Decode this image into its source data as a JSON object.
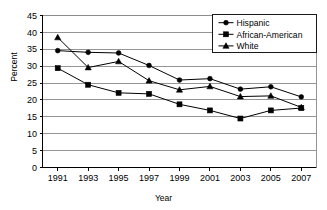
{
  "chart_data": {
    "type": "line",
    "title": "",
    "xlabel": "Year",
    "ylabel": "Percent",
    "categories": [
      "1991",
      "1993",
      "1995",
      "1997",
      "1999",
      "2001",
      "2003",
      "2005",
      "2007"
    ],
    "x": [
      1991,
      1993,
      1995,
      1997,
      1999,
      2001,
      2003,
      2005,
      2007
    ],
    "ylim": [
      0,
      45
    ],
    "yticks": [
      0,
      5,
      10,
      15,
      20,
      25,
      30,
      35,
      40,
      45
    ],
    "grid": "horizontal",
    "legend_position": "top-right-inside",
    "series": [
      {
        "name": "Hispanic",
        "marker": "circle",
        "values": [
          34.6,
          34.1,
          33.9,
          30.2,
          25.9,
          26.3,
          23.2,
          23.9,
          20.9
        ]
      },
      {
        "name": "African-American",
        "marker": "square",
        "values": [
          29.4,
          24.5,
          22.1,
          21.8,
          18.7,
          16.9,
          14.5,
          16.9,
          17.6
        ]
      },
      {
        "name": "White",
        "marker": "triangle",
        "values": [
          38.5,
          29.6,
          31.4,
          25.7,
          23.0,
          24.0,
          21.0,
          21.2,
          17.8
        ]
      }
    ]
  },
  "axes": {
    "y_axis_title": "Percent",
    "x_axis_title": "Year",
    "y_tick_labels": [
      "0",
      "5",
      "10",
      "15",
      "20",
      "25",
      "30",
      "35",
      "40",
      "45"
    ],
    "x_tick_labels": [
      "1991",
      "1993",
      "1995",
      "1997",
      "1999",
      "2001",
      "2003",
      "2005",
      "2007"
    ]
  },
  "legend": {
    "entries": [
      {
        "label": "Hispanic",
        "marker": "circle-marker"
      },
      {
        "label": "African-American",
        "marker": "square-marker"
      },
      {
        "label": "White",
        "marker": "triangle-marker"
      }
    ]
  },
  "colors": {
    "line": "#000000",
    "marker": "#000000",
    "grid": "#808080",
    "axis": "#000000",
    "background": "#ffffff"
  }
}
